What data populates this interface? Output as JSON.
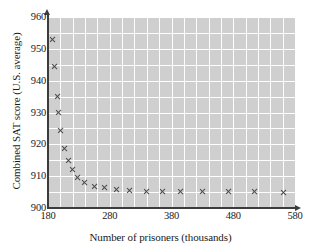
{
  "chart_data": {
    "type": "scatter",
    "title": "",
    "xlabel": "Number of prisoners (thousands)",
    "ylabel": "Combined SAT score (U.S. average)",
    "xlim": [
      180,
      580
    ],
    "ylim": [
      900,
      960
    ],
    "xticks": [
      180,
      280,
      380,
      480,
      580
    ],
    "yticks": [
      900,
      910,
      920,
      930,
      940,
      950,
      960
    ],
    "grid": true,
    "grid_x_step": 20,
    "grid_y_step": 5,
    "legend": "none",
    "marker": "x",
    "marker_color": "#4a4a4a",
    "plot_background": "#cfcfcf",
    "gridline_color": "#ffffff",
    "axis_color": "#3c3c3c",
    "series": [
      {
        "name": "SAT score vs prisoners",
        "points": [
          {
            "x": 187,
            "y": 953.0
          },
          {
            "x": 191,
            "y": 944.3
          },
          {
            "x": 195,
            "y": 935.0
          },
          {
            "x": 197,
            "y": 930.0
          },
          {
            "x": 200,
            "y": 924.5
          },
          {
            "x": 207,
            "y": 918.6
          },
          {
            "x": 213,
            "y": 915.0
          },
          {
            "x": 220,
            "y": 912.0
          },
          {
            "x": 228,
            "y": 909.7
          },
          {
            "x": 240,
            "y": 908.0
          },
          {
            "x": 255,
            "y": 906.8
          },
          {
            "x": 272,
            "y": 906.5
          },
          {
            "x": 292,
            "y": 905.7
          },
          {
            "x": 313,
            "y": 905.4
          },
          {
            "x": 340,
            "y": 905.3
          },
          {
            "x": 365,
            "y": 905.2
          },
          {
            "x": 395,
            "y": 905.3
          },
          {
            "x": 430,
            "y": 905.2
          },
          {
            "x": 473,
            "y": 905.1
          },
          {
            "x": 515,
            "y": 905.2
          },
          {
            "x": 562,
            "y": 905.0
          }
        ]
      }
    ]
  }
}
